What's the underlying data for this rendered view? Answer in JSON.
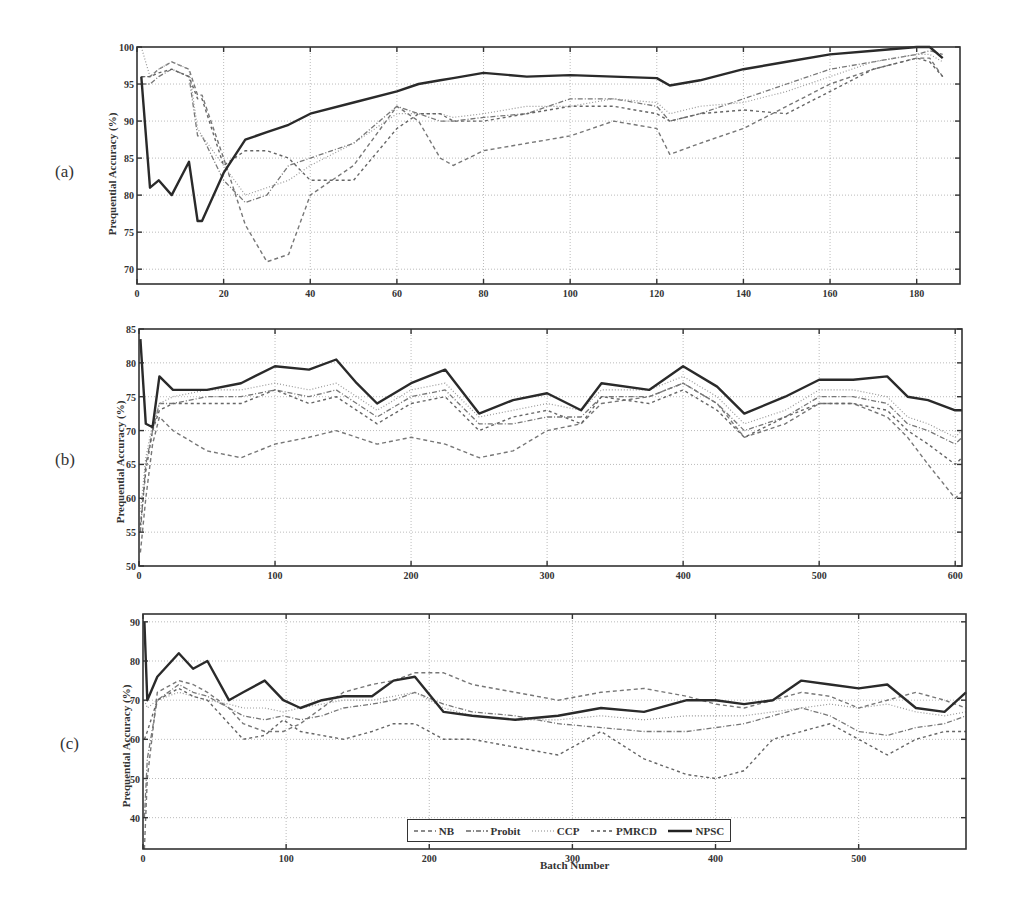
{
  "figure": {
    "panels": [
      {
        "label": "(a)",
        "ylabel": "Prequential Accuracy (%)"
      },
      {
        "label": "(b)",
        "ylabel": "Prequential Accuracy (%)"
      },
      {
        "label": "(c)",
        "ylabel": "Prequential Accuracy (%)"
      }
    ],
    "xlabel": "Batch Number",
    "legend": [
      "NB",
      "Probit",
      "CCP",
      "PMRCD",
      "NPSC"
    ]
  },
  "chart_data": [
    {
      "type": "line",
      "title": "(a)",
      "xlabel": "",
      "ylabel": "Prequential Accuracy (%)",
      "xlim": [
        0,
        190
      ],
      "ylim": [
        68,
        100
      ],
      "xticks": [
        0,
        20,
        40,
        60,
        80,
        100,
        120,
        140,
        160,
        180
      ],
      "yticks": [
        70,
        75,
        80,
        85,
        90,
        95,
        100
      ],
      "grid": true,
      "x": [
        1,
        3,
        5,
        8,
        12,
        14,
        15,
        20,
        25,
        30,
        35,
        40,
        50,
        60,
        65,
        70,
        73,
        80,
        90,
        100,
        110,
        120,
        123,
        130,
        140,
        150,
        160,
        170,
        180,
        183,
        186
      ],
      "series": [
        {
          "name": "NPSC",
          "style": "solid",
          "values": [
            96,
            81,
            82,
            80,
            84.5,
            76.5,
            76.5,
            83,
            87.5,
            88.5,
            89.5,
            91,
            92.5,
            94,
            95,
            95.5,
            95.8,
            96.5,
            96,
            96.2,
            96,
            95.8,
            94.8,
            95.5,
            97,
            98,
            99,
            99.5,
            100,
            100,
            98.5
          ]
        },
        {
          "name": "NB",
          "style": "dashed",
          "values": [
            96,
            96,
            97,
            98,
            97,
            93.5,
            93.5,
            85,
            76,
            71,
            72,
            80,
            84,
            92,
            90,
            85,
            84,
            86,
            87,
            88,
            90,
            89,
            85.5,
            87,
            89,
            92,
            95,
            97,
            98.5,
            98.5,
            96
          ]
        },
        {
          "name": "Probit",
          "style": "dashdot",
          "values": [
            95,
            95,
            96,
            97,
            96,
            88,
            88,
            82,
            79,
            80,
            84,
            85,
            87,
            92,
            91,
            90,
            90,
            90.5,
            91,
            93,
            93,
            92,
            90,
            91,
            93,
            95,
            97,
            98,
            99,
            99.5,
            99
          ]
        },
        {
          "name": "CCP",
          "style": "dotted",
          "values": [
            100,
            96,
            97,
            98,
            97,
            89,
            88,
            84,
            80,
            81,
            82,
            84,
            87,
            91,
            91,
            91,
            90.5,
            91,
            92,
            92,
            93,
            92.5,
            91,
            92,
            92.5,
            94,
            96,
            98,
            99,
            99,
            98
          ]
        },
        {
          "name": "PMRCD",
          "style": "dashed-sparse",
          "values": [
            96,
            96,
            96.5,
            97,
            96,
            93,
            93,
            84,
            86,
            86,
            85,
            82,
            82,
            89,
            91,
            91,
            90,
            90,
            91,
            92,
            92,
            91,
            90,
            91,
            91.5,
            91,
            94,
            97,
            98.5,
            98,
            96
          ]
        }
      ]
    },
    {
      "type": "line",
      "title": "(b)",
      "xlabel": "",
      "ylabel": "Prequential Accuracy (%)",
      "xlim": [
        0,
        605
      ],
      "ylim": [
        50,
        85
      ],
      "xticks": [
        0,
        100,
        200,
        300,
        400,
        500,
        600
      ],
      "yticks": [
        50,
        55,
        60,
        65,
        70,
        75,
        80,
        85
      ],
      "grid": true,
      "x": [
        1,
        5,
        10,
        15,
        25,
        50,
        75,
        100,
        125,
        145,
        160,
        175,
        200,
        225,
        250,
        275,
        300,
        325,
        340,
        375,
        400,
        425,
        445,
        475,
        500,
        525,
        550,
        565,
        580,
        600,
        605
      ],
      "series": [
        {
          "name": "NPSC",
          "style": "solid",
          "values": [
            83.5,
            71,
            70.5,
            78,
            76,
            76,
            77,
            79.5,
            79,
            80.5,
            77,
            74,
            77,
            79,
            72.5,
            74.5,
            75.5,
            73,
            77,
            76,
            79.5,
            76.5,
            72.5,
            75,
            77.5,
            77.5,
            78,
            75,
            74.5,
            73,
            73
          ]
        },
        {
          "name": "NB",
          "style": "dashed",
          "values": [
            52,
            60,
            68,
            72,
            70,
            67,
            66,
            68,
            69,
            70,
            69,
            68,
            69,
            68,
            66,
            67,
            70,
            71,
            74,
            75,
            77,
            74,
            69,
            71,
            74,
            74,
            72,
            69,
            65,
            60,
            61
          ]
        },
        {
          "name": "Probit",
          "style": "dashdot",
          "values": [
            55,
            65,
            70,
            74,
            74,
            75,
            75,
            76,
            75,
            76,
            74,
            72,
            75,
            76,
            71,
            71,
            72,
            72,
            75,
            75,
            77,
            74,
            70,
            72,
            75,
            75,
            74,
            71,
            70,
            68,
            69
          ]
        },
        {
          "name": "CCP",
          "style": "dotted",
          "values": [
            58,
            66,
            71,
            74,
            75,
            76,
            76,
            77,
            76,
            77,
            75,
            73,
            76,
            77,
            72,
            73,
            74,
            73,
            76,
            76,
            78,
            75,
            71,
            73,
            76,
            76,
            75,
            72,
            71,
            69,
            70
          ]
        },
        {
          "name": "PMRCD",
          "style": "dashed-sparse",
          "values": [
            56,
            64,
            70,
            73,
            74,
            74,
            74,
            76,
            74,
            75,
            73,
            71,
            74,
            75,
            70,
            72,
            73,
            71,
            75,
            74,
            76,
            73,
            69,
            72,
            74,
            74,
            73,
            70,
            68,
            65,
            66
          ]
        }
      ]
    },
    {
      "type": "line",
      "title": "(c)",
      "xlabel": "Batch Number",
      "ylabel": "Prequential Accuracy (%)",
      "xlim": [
        0,
        575
      ],
      "ylim": [
        32,
        92
      ],
      "xticks": [
        0,
        100,
        200,
        300,
        400,
        500
      ],
      "yticks": [
        40,
        50,
        60,
        70,
        80,
        90
      ],
      "grid": true,
      "legend": {
        "entries": [
          "NB",
          "Probit",
          "CCP",
          "PMRCD",
          "NPSC"
        ],
        "position": "lower center"
      },
      "x": [
        1,
        3,
        10,
        25,
        35,
        45,
        60,
        70,
        85,
        98,
        110,
        125,
        140,
        160,
        175,
        190,
        210,
        230,
        260,
        290,
        320,
        350,
        380,
        400,
        420,
        440,
        460,
        480,
        500,
        520,
        540,
        560,
        575
      ],
      "series": [
        {
          "name": "NPSC",
          "style": "solid",
          "values": [
            90,
            70,
            76,
            82,
            78,
            80,
            70,
            72,
            75,
            70,
            68,
            70,
            71,
            71,
            75,
            76,
            67,
            66,
            65,
            66,
            68,
            67,
            70,
            70,
            69,
            70,
            75,
            74,
            73,
            74,
            68,
            67,
            72
          ]
        },
        {
          "name": "NB",
          "style": "dashed",
          "values": [
            32,
            50,
            72,
            75,
            74,
            72,
            68,
            64,
            62,
            62,
            64,
            68,
            72,
            74,
            75,
            77,
            77,
            74,
            72,
            70,
            72,
            73,
            71,
            69,
            68,
            70,
            72,
            71,
            68,
            70,
            72,
            70,
            68
          ]
        },
        {
          "name": "Probit",
          "style": "dashdot",
          "values": [
            40,
            55,
            70,
            74,
            72,
            71,
            68,
            66,
            65,
            66,
            65,
            66,
            68,
            69,
            70,
            72,
            69,
            67,
            66,
            64,
            63,
            62,
            62,
            63,
            64,
            66,
            68,
            66,
            62,
            61,
            63,
            64,
            66
          ]
        },
        {
          "name": "CCP",
          "style": "dotted",
          "values": [
            70,
            68,
            70,
            72,
            71,
            70,
            69,
            68,
            68,
            67,
            68,
            69,
            70,
            70,
            71,
            72,
            68,
            66,
            65,
            65,
            66,
            65,
            66,
            66,
            66,
            67,
            68,
            69,
            68,
            69,
            67,
            66,
            67
          ]
        },
        {
          "name": "PMRCD",
          "style": "dashed-sparse",
          "values": [
            60,
            62,
            70,
            73,
            71,
            70,
            64,
            60,
            61,
            65,
            62,
            61,
            60,
            62,
            64,
            64,
            60,
            60,
            58,
            56,
            62,
            55,
            51,
            50,
            52,
            60,
            62,
            64,
            60,
            56,
            60,
            62,
            62
          ]
        }
      ]
    }
  ]
}
